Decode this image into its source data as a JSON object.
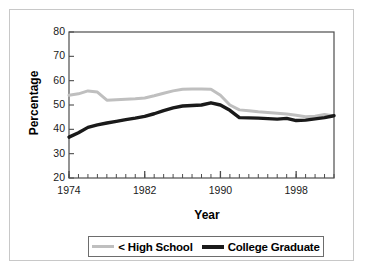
{
  "chart_data": {
    "type": "line",
    "title": "",
    "xlabel": "Year",
    "ylabel": "Percentage",
    "xlim": [
      1974,
      2002
    ],
    "ylim": [
      20,
      80
    ],
    "ytick_labels": [
      "80",
      "70",
      "60",
      "50",
      "40",
      "30",
      "20"
    ],
    "ytick_values": [
      80,
      70,
      60,
      50,
      40,
      30,
      20
    ],
    "xtick_labels": [
      "1974",
      "1982",
      "1990",
      "1998"
    ],
    "xtick_values": [
      1974,
      1982,
      1990,
      1998
    ],
    "minor_xticks": "every year",
    "grid": false,
    "legend_position": "below-axes",
    "x": [
      1974,
      1975,
      1976,
      1977,
      1978,
      1979,
      1980,
      1981,
      1982,
      1983,
      1984,
      1985,
      1986,
      1987,
      1988,
      1989,
      1990,
      1991,
      1992,
      1993,
      1994,
      1995,
      1996,
      1997,
      1998,
      1999,
      2000,
      2001,
      2002
    ],
    "series": [
      {
        "name": "< High School",
        "color": "#bfbfbf",
        "values": [
          54.0,
          54.6,
          55.8,
          55.3,
          52.0,
          52.2,
          52.4,
          52.6,
          52.9,
          53.8,
          54.8,
          55.8,
          56.5,
          56.6,
          56.6,
          56.5,
          54.0,
          50.0,
          48.0,
          47.6,
          47.2,
          46.9,
          46.6,
          46.3,
          45.8,
          45.2,
          45.4,
          46.1,
          45.5
        ]
      },
      {
        "name": "College Graduate",
        "color": "#1a1a1a",
        "values": [
          36.8,
          38.6,
          40.8,
          41.8,
          42.6,
          43.3,
          44.0,
          44.6,
          45.3,
          46.4,
          47.7,
          48.8,
          49.6,
          49.8,
          50.0,
          50.9,
          50.0,
          47.8,
          44.8,
          44.7,
          44.6,
          44.4,
          44.2,
          44.5,
          43.6,
          43.8,
          44.3,
          44.8,
          45.6
        ]
      }
    ]
  },
  "legend": {
    "entries": [
      {
        "label": "< High School",
        "swatch": "gray-line-swatch"
      },
      {
        "label": "College Graduate",
        "swatch": "black-line-swatch"
      }
    ]
  }
}
